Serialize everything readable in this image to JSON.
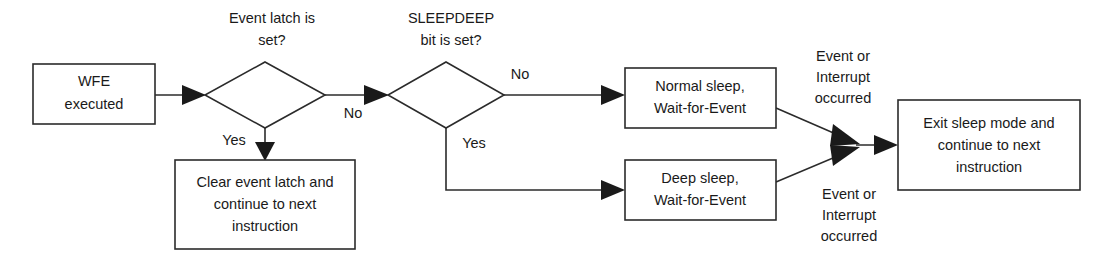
{
  "diagram": {
    "type": "flowchart",
    "canvas": {
      "width": 1109,
      "height": 264
    },
    "colors": {
      "background": "#ffffff",
      "stroke": "#2b2b2b",
      "text": "#1a1a1a",
      "arrow_fill": "#1a1a1a"
    },
    "nodes": {
      "wfe_executed": {
        "line1": "WFE",
        "line2": "executed"
      },
      "clear_event_latch": {
        "line1": "Clear event latch and",
        "line2": "continue to next",
        "line3": "instruction"
      },
      "normal_sleep": {
        "line1": "Normal sleep,",
        "line2": "Wait-for-Event"
      },
      "deep_sleep": {
        "line1": "Deep sleep,",
        "line2": "Wait-for-Event"
      },
      "exit_sleep": {
        "line1": "Exit sleep mode and",
        "line2": "continue to next",
        "line3": "instruction"
      }
    },
    "decisions": {
      "event_latch": {
        "caption_line1": "Event latch is",
        "caption_line2": "set?"
      },
      "sleepdeep": {
        "caption_line1": "SLEEPDEEP",
        "caption_line2": "bit is set?"
      }
    },
    "edge_labels": {
      "event_latch_yes": "Yes",
      "event_latch_no": "No",
      "sleepdeep_no": "No",
      "sleepdeep_yes": "Yes",
      "normal_sleep_exit": {
        "line1": "Event or",
        "line2": "Interrupt",
        "line3": "occurred"
      },
      "deep_sleep_exit": {
        "line1": "Event or",
        "line2": "Interrupt",
        "line3": "occurred"
      }
    }
  }
}
